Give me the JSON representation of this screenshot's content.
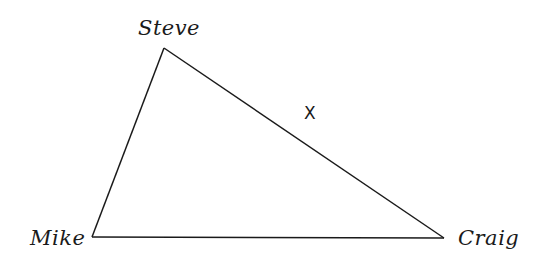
{
  "diagram": {
    "type": "triangle",
    "vertices": [
      {
        "id": "steve",
        "label": "Steve",
        "x": 164,
        "y": 48
      },
      {
        "id": "mike",
        "label": "Mike",
        "x": 92,
        "y": 237
      },
      {
        "id": "craig",
        "label": "Craig",
        "x": 444,
        "y": 238
      }
    ],
    "edges": [
      {
        "from": "steve",
        "to": "mike"
      },
      {
        "from": "mike",
        "to": "craig"
      },
      {
        "from": "steve",
        "to": "craig"
      }
    ],
    "marker": {
      "label": "X",
      "x": 310,
      "y": 113
    },
    "line_color": "#1a1a1a"
  }
}
